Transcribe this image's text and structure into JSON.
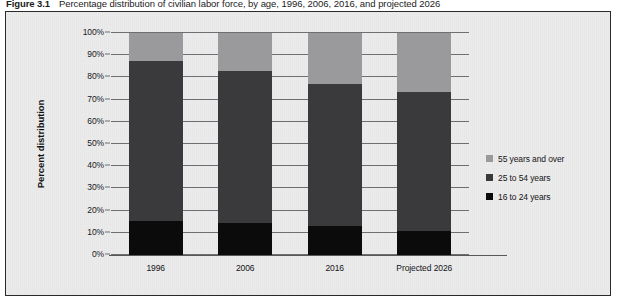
{
  "caption": {
    "label": "Figure 3.1",
    "text": "Percentage distribution of civilian labor force, by age, 1996, 2006, 2016, and projected 2026"
  },
  "colors": {
    "frame_background": "#ececed",
    "frame_border": "#2b2b2b",
    "gridline": "#6e6e70",
    "series_16_24": "#0b0b0b",
    "series_25_54": "#3a3a3c",
    "series_55_over": "#9a9a9c"
  },
  "chart_data": {
    "type": "bar",
    "stacked": true,
    "title": "Percentage distribution of civilian labor force, by age, 1996, 2006, 2016, and projected 2026",
    "xlabel": "",
    "ylabel": "Percent distribution",
    "ylim": [
      0,
      100
    ],
    "ytick_labels": [
      "0%",
      "10%",
      "20%",
      "30%",
      "40%",
      "50%",
      "60%",
      "70%",
      "80%",
      "90%",
      "100%"
    ],
    "ytick_values": [
      0,
      10,
      20,
      30,
      40,
      50,
      60,
      70,
      80,
      90,
      100
    ],
    "grid": true,
    "legend_position": "right",
    "categories": [
      "1996",
      "2006",
      "2016",
      "Projected 2026"
    ],
    "series": [
      {
        "name": "16 to 24 years",
        "color": "#0b0b0b",
        "values": [
          15.5,
          14.5,
          13.0,
          11.0
        ]
      },
      {
        "name": "25 to 54 years",
        "color": "#3a3a3c",
        "values": [
          72.0,
          68.5,
          64.0,
          62.5
        ]
      },
      {
        "name": "55 years and over",
        "color": "#9a9a9c",
        "values": [
          12.5,
          17.0,
          23.0,
          26.5
        ]
      }
    ]
  }
}
